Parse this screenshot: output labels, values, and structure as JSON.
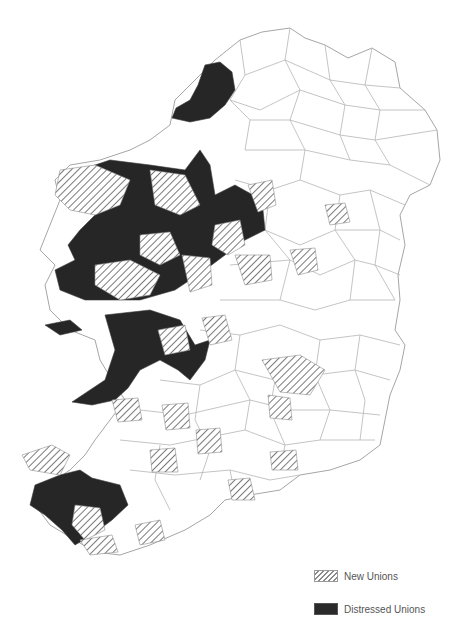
{
  "map": {
    "subject": "Ireland poor law unions",
    "colors": {
      "background": "#ffffff",
      "boundary": "#a6a6a6",
      "distressed_fill": "#2a2a2a",
      "new_hatch": "#8a8a8a"
    }
  },
  "legend": {
    "items": [
      {
        "label": "New Unions",
        "style": "hatched"
      },
      {
        "label": "Distressed Unions",
        "style": "solid-black"
      }
    ]
  },
  "footnote": {
    "text": ""
  }
}
